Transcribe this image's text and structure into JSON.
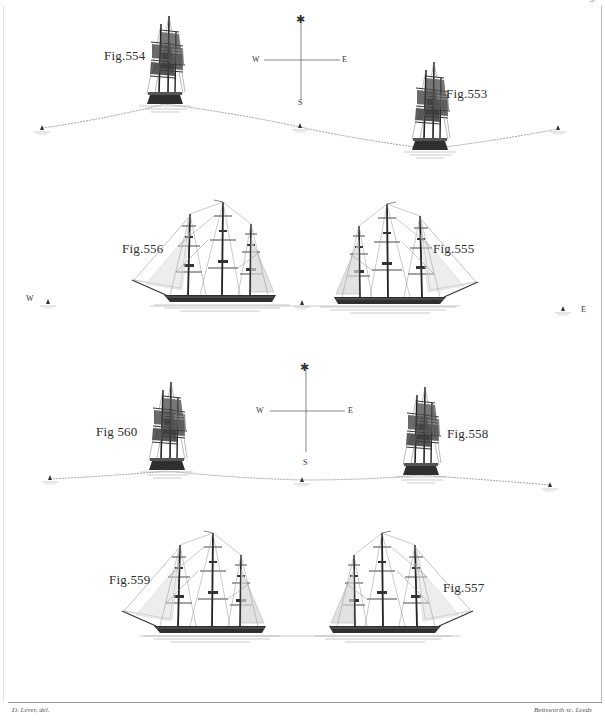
{
  "plate": {
    "page_number": "9",
    "credits": {
      "left": "D. Lever, del.",
      "right": "Bettsworth sc. Leeds"
    }
  },
  "compasses": [
    {
      "id": "upper",
      "north_symbol": "✱",
      "west": "W",
      "east": "E",
      "south": "S"
    },
    {
      "id": "lower",
      "north_symbol": "✱",
      "west": "W",
      "east": "E",
      "south": "S"
    }
  ],
  "wind_markers": {
    "west": "W",
    "east": "E"
  },
  "figures": [
    {
      "id": "fig-554",
      "label": "Fig.554",
      "view": "stern view, on crest"
    },
    {
      "id": "fig-553",
      "label": "Fig.553",
      "view": "stern view, in trough"
    },
    {
      "id": "fig-556",
      "label": "Fig.556",
      "view": "broadside, heading left"
    },
    {
      "id": "fig-555",
      "label": "Fig.555",
      "view": "broadside, heading right"
    },
    {
      "id": "fig-560",
      "label": "Fig 560",
      "view": "stern view, left"
    },
    {
      "id": "fig-558",
      "label": "Fig.558",
      "view": "stern view, right"
    },
    {
      "id": "fig-559",
      "label": "Fig.559",
      "view": "broadside, heading left"
    },
    {
      "id": "fig-557",
      "label": "Fig.557",
      "view": "broadside, heading right"
    }
  ],
  "colors": {
    "paper": "#ffffff",
    "ink": "#2a2a2a",
    "rigging": "#6a6a6a",
    "sail": "#8a8a8a",
    "track": "#7a7a7a"
  }
}
